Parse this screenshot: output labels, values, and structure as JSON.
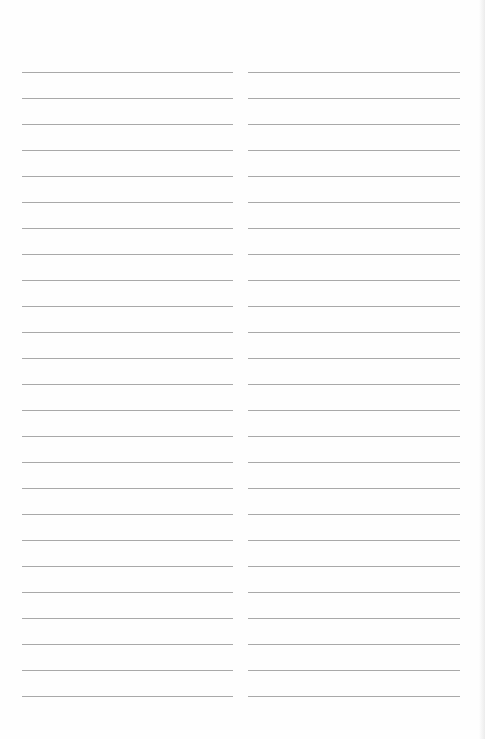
{
  "document": {
    "type": "lined-paper",
    "columns": 2,
    "lines_per_column": 25,
    "line_spacing_px": 26,
    "line_color": "#a9a9a9",
    "background_color": "#ffffff"
  }
}
